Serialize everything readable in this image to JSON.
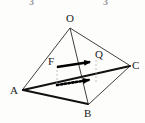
{
  "figure": {
    "type": "solid-geometry",
    "background_color": "#fdfdfc",
    "stroke_color": "#2a2a2a",
    "bold_stroke_color": "#000000",
    "guide_color": "#a8a8a8",
    "cropped_text_color": "#9a9a9a"
  },
  "cropped_header": {
    "left_fragment": "3",
    "right_fragment": "3"
  },
  "vertices": {
    "O": {
      "label": "O",
      "x": 70,
      "y": 26
    },
    "A": {
      "label": "A",
      "x": 22,
      "y": 90
    },
    "B": {
      "label": "B",
      "x": 89,
      "y": 105
    },
    "C": {
      "label": "C",
      "x": 130,
      "y": 66
    }
  },
  "points": {
    "F": {
      "label": "F",
      "x": 56,
      "y": 67
    },
    "Q": {
      "label": "Q",
      "x": 97,
      "y": 60
    }
  },
  "edges": [
    {
      "name": "OA",
      "from": "O",
      "to": "A",
      "style": "solid-thin"
    },
    {
      "name": "OB",
      "from": "O",
      "to": "B",
      "style": "solid-thin"
    },
    {
      "name": "OC",
      "from": "O",
      "to": "C",
      "style": "solid-thin"
    },
    {
      "name": "AB",
      "from": "A",
      "to": "B",
      "style": "solid-bold"
    },
    {
      "name": "BC",
      "from": "B",
      "to": "C",
      "style": "solid-thin"
    },
    {
      "name": "AC",
      "from": "A",
      "to": "C",
      "style": "solid-bold"
    }
  ],
  "vectors": [
    {
      "name": "upper-solid-vector",
      "style": "solid-bold-arrow",
      "from": {
        "x": 57,
        "y": 67
      },
      "to": {
        "x": 96,
        "y": 62
      },
      "label": "Q"
    },
    {
      "name": "lower-dotted-vector",
      "style": "dotted-bold-arrow",
      "from": {
        "x": 57,
        "y": 85
      },
      "to": {
        "x": 96,
        "y": 80
      },
      "label": ""
    }
  ],
  "guide_lines": [
    {
      "name": "left-guide",
      "x": 57,
      "y1": 67,
      "y2": 86,
      "style": "dashed"
    },
    {
      "name": "right-guide",
      "x": 96,
      "y1": 61,
      "y2": 81,
      "style": "dashed"
    }
  ]
}
